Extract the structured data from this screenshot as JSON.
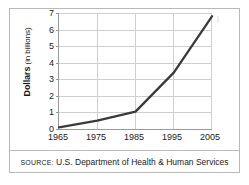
{
  "chart_data": {
    "type": "line",
    "title": "",
    "xlabel": "",
    "ylabel": "Dollars (in billions)",
    "ylabel_bold_part": "Dollars",
    "ylabel_light_part": "(in billions)",
    "x": [
      1965,
      1975,
      1985,
      1995,
      2005
    ],
    "values": [
      0.1,
      0.5,
      1.05,
      3.4,
      6.8
    ],
    "series": [
      {
        "name": "Dollars (in billions)",
        "values": [
          0.1,
          0.5,
          1.05,
          3.4,
          6.8
        ]
      }
    ],
    "xtick_labels": [
      "1965",
      "1975",
      "1985",
      "1995",
      "2005"
    ],
    "ytick_labels": [
      "0",
      "1",
      "2",
      "3",
      "4",
      "5",
      "6",
      "7"
    ],
    "ytick_values": [
      0,
      1,
      2,
      3,
      4,
      5,
      6,
      7
    ],
    "xlim": [
      1965,
      2005
    ],
    "ylim": [
      0,
      7
    ],
    "grid": "both",
    "legend": "none",
    "line_color": "#3a3a3a",
    "grid_color": "#cfcfcf",
    "axis_color": "#9a9a9a"
  },
  "source": {
    "label": "SOURCE:",
    "text": "U.S. Department of Health & Human Services"
  }
}
